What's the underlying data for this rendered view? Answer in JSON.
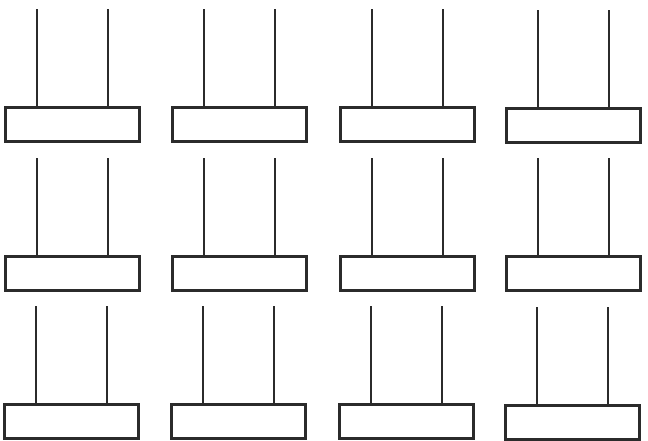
{
  "worksheet": {
    "type": "blank abacus frames",
    "rows": 3,
    "columns": 4,
    "rods_per_abacus": 2,
    "line_color": "#2b2b2b",
    "frames": [
      {
        "row": 1,
        "col": 1,
        "x": 4,
        "y": 9
      },
      {
        "row": 1,
        "col": 2,
        "x": 171,
        "y": 9
      },
      {
        "row": 1,
        "col": 3,
        "x": 339,
        "y": 9
      },
      {
        "row": 1,
        "col": 4,
        "x": 505,
        "y": 10
      },
      {
        "row": 2,
        "col": 1,
        "x": 4,
        "y": 158
      },
      {
        "row": 2,
        "col": 2,
        "x": 171,
        "y": 158
      },
      {
        "row": 2,
        "col": 3,
        "x": 339,
        "y": 158
      },
      {
        "row": 2,
        "col": 4,
        "x": 505,
        "y": 158
      },
      {
        "row": 3,
        "col": 1,
        "x": 3,
        "y": 306
      },
      {
        "row": 3,
        "col": 2,
        "x": 170,
        "y": 306
      },
      {
        "row": 3,
        "col": 3,
        "x": 338,
        "y": 306
      },
      {
        "row": 3,
        "col": 4,
        "x": 504,
        "y": 307
      }
    ]
  }
}
